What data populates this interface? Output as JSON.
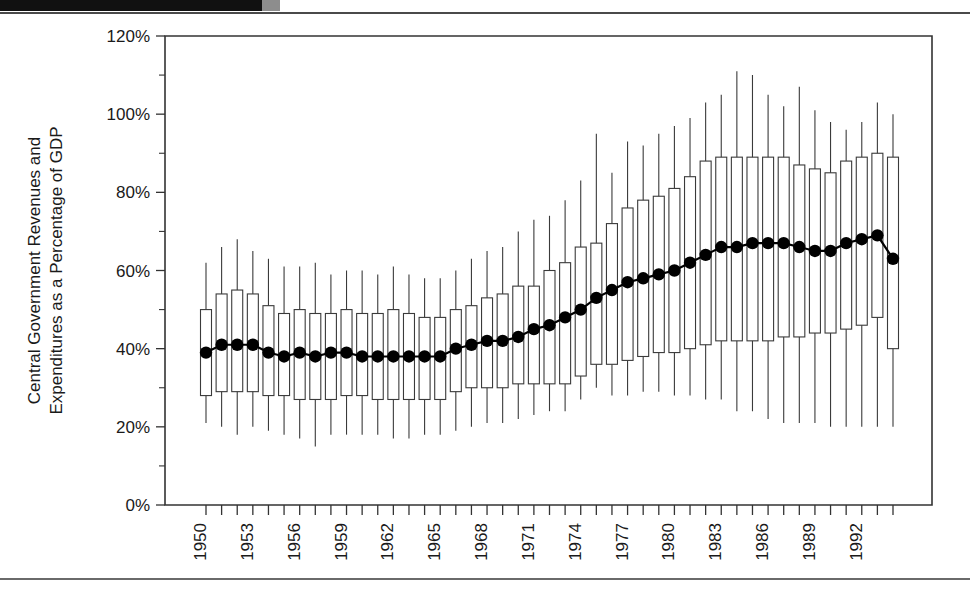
{
  "page": {
    "top_band_label": "",
    "has_top_rule": true,
    "has_bottom_rule": true
  },
  "chart_data": {
    "type": "box",
    "title": "",
    "xlabel": "",
    "ylabel": "Central Government Revenues and Expenditures as a Percentage of GDP",
    "ylim": [
      0,
      120
    ],
    "y_tick_labels": [
      "0%",
      "20%",
      "40%",
      "60%",
      "80%",
      "100%",
      "120%"
    ],
    "y_ticks": [
      0,
      20,
      40,
      60,
      80,
      100,
      120
    ],
    "y_minor_ticks": [
      10,
      30,
      50,
      70,
      90,
      110
    ],
    "y_unit": "%",
    "grid": false,
    "legend": null,
    "x_tick_labels": [
      "1950",
      "1953",
      "1956",
      "1959",
      "1962",
      "1965",
      "1968",
      "1971",
      "1974",
      "1977",
      "1980",
      "1983",
      "1986",
      "1989",
      "1992"
    ],
    "x_label_years": [
      1950,
      1953,
      1956,
      1959,
      1962,
      1965,
      1968,
      1971,
      1974,
      1977,
      1980,
      1983,
      1986,
      1989,
      1992
    ],
    "x_label_rotation": -90,
    "categories": [
      1950,
      1951,
      1952,
      1953,
      1954,
      1955,
      1956,
      1957,
      1958,
      1959,
      1960,
      1961,
      1962,
      1963,
      1964,
      1965,
      1966,
      1967,
      1968,
      1969,
      1970,
      1971,
      1972,
      1973,
      1974,
      1975,
      1976,
      1977,
      1978,
      1979,
      1980,
      1981,
      1982,
      1983,
      1984,
      1985,
      1986,
      1987,
      1988,
      1989,
      1990,
      1991,
      1992,
      1993,
      1994
    ],
    "marker_series_name": "Mean",
    "boxes": [
      {
        "year": 1950,
        "whisker_low": 21,
        "q1": 28,
        "q3": 50,
        "whisker_high": 62,
        "mean": 39
      },
      {
        "year": 1951,
        "whisker_low": 20,
        "q1": 29,
        "q3": 54,
        "whisker_high": 66,
        "mean": 41
      },
      {
        "year": 1952,
        "whisker_low": 18,
        "q1": 29,
        "q3": 55,
        "whisker_high": 68,
        "mean": 41
      },
      {
        "year": 1953,
        "whisker_low": 20,
        "q1": 29,
        "q3": 54,
        "whisker_high": 65,
        "mean": 41
      },
      {
        "year": 1954,
        "whisker_low": 19,
        "q1": 28,
        "q3": 51,
        "whisker_high": 63,
        "mean": 39
      },
      {
        "year": 1955,
        "whisker_low": 18,
        "q1": 28,
        "q3": 49,
        "whisker_high": 61,
        "mean": 38
      },
      {
        "year": 1956,
        "whisker_low": 17,
        "q1": 27,
        "q3": 50,
        "whisker_high": 61,
        "mean": 39
      },
      {
        "year": 1957,
        "whisker_low": 15,
        "q1": 27,
        "q3": 49,
        "whisker_high": 62,
        "mean": 38
      },
      {
        "year": 1958,
        "whisker_low": 18,
        "q1": 27,
        "q3": 49,
        "whisker_high": 59,
        "mean": 39
      },
      {
        "year": 1959,
        "whisker_low": 18,
        "q1": 28,
        "q3": 50,
        "whisker_high": 60,
        "mean": 39
      },
      {
        "year": 1960,
        "whisker_low": 18,
        "q1": 28,
        "q3": 49,
        "whisker_high": 60,
        "mean": 38
      },
      {
        "year": 1961,
        "whisker_low": 18,
        "q1": 27,
        "q3": 49,
        "whisker_high": 59,
        "mean": 38
      },
      {
        "year": 1962,
        "whisker_low": 17,
        "q1": 27,
        "q3": 50,
        "whisker_high": 61,
        "mean": 38
      },
      {
        "year": 1963,
        "whisker_low": 17,
        "q1": 27,
        "q3": 49,
        "whisker_high": 59,
        "mean": 38
      },
      {
        "year": 1964,
        "whisker_low": 18,
        "q1": 27,
        "q3": 48,
        "whisker_high": 58,
        "mean": 38
      },
      {
        "year": 1965,
        "whisker_low": 18,
        "q1": 27,
        "q3": 48,
        "whisker_high": 58,
        "mean": 38
      },
      {
        "year": 1966,
        "whisker_low": 19,
        "q1": 29,
        "q3": 50,
        "whisker_high": 60,
        "mean": 40
      },
      {
        "year": 1967,
        "whisker_low": 20,
        "q1": 30,
        "q3": 51,
        "whisker_high": 63,
        "mean": 41
      },
      {
        "year": 1968,
        "whisker_low": 21,
        "q1": 30,
        "q3": 53,
        "whisker_high": 65,
        "mean": 42
      },
      {
        "year": 1969,
        "whisker_low": 21,
        "q1": 30,
        "q3": 54,
        "whisker_high": 66,
        "mean": 42
      },
      {
        "year": 1970,
        "whisker_low": 22,
        "q1": 31,
        "q3": 56,
        "whisker_high": 70,
        "mean": 43
      },
      {
        "year": 1971,
        "whisker_low": 23,
        "q1": 31,
        "q3": 56,
        "whisker_high": 73,
        "mean": 45
      },
      {
        "year": 1972,
        "whisker_low": 24,
        "q1": 31,
        "q3": 60,
        "whisker_high": 74,
        "mean": 46
      },
      {
        "year": 1973,
        "whisker_low": 24,
        "q1": 31,
        "q3": 62,
        "whisker_high": 78,
        "mean": 48
      },
      {
        "year": 1974,
        "whisker_low": 27,
        "q1": 33,
        "q3": 66,
        "whisker_high": 83,
        "mean": 50
      },
      {
        "year": 1975,
        "whisker_low": 30,
        "q1": 36,
        "q3": 67,
        "whisker_high": 95,
        "mean": 53
      },
      {
        "year": 1976,
        "whisker_low": 28,
        "q1": 36,
        "q3": 72,
        "whisker_high": 85,
        "mean": 55
      },
      {
        "year": 1977,
        "whisker_low": 28,
        "q1": 37,
        "q3": 76,
        "whisker_high": 93,
        "mean": 57
      },
      {
        "year": 1978,
        "whisker_low": 29,
        "q1": 38,
        "q3": 78,
        "whisker_high": 92,
        "mean": 58
      },
      {
        "year": 1979,
        "whisker_low": 29,
        "q1": 39,
        "q3": 79,
        "whisker_high": 95,
        "mean": 59
      },
      {
        "year": 1980,
        "whisker_low": 28,
        "q1": 39,
        "q3": 81,
        "whisker_high": 97,
        "mean": 60
      },
      {
        "year": 1981,
        "whisker_low": 28,
        "q1": 40,
        "q3": 84,
        "whisker_high": 99,
        "mean": 62
      },
      {
        "year": 1982,
        "whisker_low": 27,
        "q1": 41,
        "q3": 88,
        "whisker_high": 103,
        "mean": 64
      },
      {
        "year": 1983,
        "whisker_low": 27,
        "q1": 42,
        "q3": 89,
        "whisker_high": 105,
        "mean": 66
      },
      {
        "year": 1984,
        "whisker_low": 24,
        "q1": 42,
        "q3": 89,
        "whisker_high": 111,
        "mean": 66
      },
      {
        "year": 1985,
        "whisker_low": 24,
        "q1": 42,
        "q3": 89,
        "whisker_high": 110,
        "mean": 67
      },
      {
        "year": 1986,
        "whisker_low": 22,
        "q1": 42,
        "q3": 89,
        "whisker_high": 105,
        "mean": 67
      },
      {
        "year": 1987,
        "whisker_low": 21,
        "q1": 43,
        "q3": 89,
        "whisker_high": 102,
        "mean": 67
      },
      {
        "year": 1988,
        "whisker_low": 21,
        "q1": 43,
        "q3": 87,
        "whisker_high": 107,
        "mean": 66
      },
      {
        "year": 1989,
        "whisker_low": 21,
        "q1": 44,
        "q3": 86,
        "whisker_high": 101,
        "mean": 65
      },
      {
        "year": 1990,
        "whisker_low": 20,
        "q1": 44,
        "q3": 85,
        "whisker_high": 98,
        "mean": 65
      },
      {
        "year": 1991,
        "whisker_low": 20,
        "q1": 45,
        "q3": 88,
        "whisker_high": 96,
        "mean": 67
      },
      {
        "year": 1992,
        "whisker_low": 20,
        "q1": 46,
        "q3": 89,
        "whisker_high": 98,
        "mean": 68
      },
      {
        "year": 1993,
        "whisker_low": 20,
        "q1": 48,
        "q3": 90,
        "whisker_high": 103,
        "mean": 69
      },
      {
        "year": 1994,
        "whisker_low": 20,
        "q1": 40,
        "q3": 89,
        "whisker_high": 100,
        "mean": 63
      }
    ]
  }
}
